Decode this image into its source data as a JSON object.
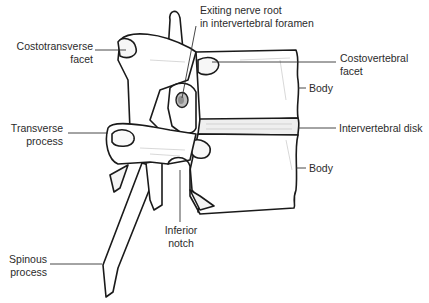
{
  "diagram": {
    "labels": {
      "exiting_nerve_root": {
        "line1": "Exiting nerve root",
        "line2": "in intervertebral foramen"
      },
      "costotransverse_facet": {
        "line1": "Costotransverse",
        "line2": "facet"
      },
      "costovertebral_facet": {
        "line1": "Costovertebral",
        "line2": "facet"
      },
      "body_upper": {
        "line1": "Body"
      },
      "transverse_process": {
        "line1": "Transverse",
        "line2": "process"
      },
      "intervertebral_disk": {
        "line1": "Intervertebral disk"
      },
      "body_lower": {
        "line1": "Body"
      },
      "inferior_notch": {
        "line1": "Inferior",
        "line2": "notch"
      },
      "spinous_process": {
        "line1": "Spinous",
        "line2": "process"
      }
    },
    "colors": {
      "outline": "#1a1a1a",
      "bone_fill": "#ffffff",
      "shading": "#cfcfcf",
      "leader_line": "#333333",
      "text": "#2b2b2b"
    }
  }
}
